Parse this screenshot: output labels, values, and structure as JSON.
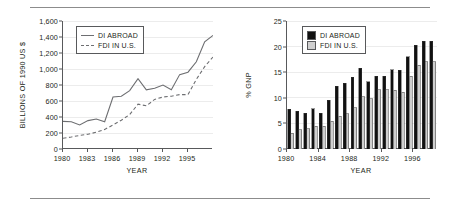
{
  "figure": {
    "panels": [
      {
        "id": "left",
        "ylabel": "BILLIONS OF 1990 US $",
        "xlabel": "YEAR",
        "legend": [
          {
            "label": "DI ABROAD",
            "style": "solid"
          },
          {
            "label": "FDI IN U.S.",
            "style": "dashed"
          }
        ]
      },
      {
        "id": "right",
        "ylabel": "% GNP",
        "xlabel": "YEAR",
        "legend": [
          {
            "label": "DI ABROAD",
            "style": "black"
          },
          {
            "label": "FDI IN U.S.",
            "style": "gray"
          }
        ]
      }
    ]
  },
  "chart_data": [
    {
      "type": "line",
      "title": "",
      "xlabel": "YEAR",
      "ylabel": "BILLIONS OF 1990 US $",
      "xlim": [
        1980,
        1998
      ],
      "ylim": [
        0,
        1600
      ],
      "yticks": [
        0,
        200,
        400,
        600,
        800,
        1000,
        1200,
        1400,
        1600
      ],
      "ytick_labels": [
        "0",
        "200",
        "400",
        "600",
        "800",
        "1,000",
        "1,200",
        "1,400",
        "1,600"
      ],
      "xticks": [
        1980,
        1983,
        1986,
        1989,
        1992,
        1995
      ],
      "xtick_labels": [
        "1980",
        "1983",
        "1986",
        "1989",
        "1992",
        "1995"
      ],
      "grid": true,
      "legend_position": "upper-left",
      "x": [
        1980,
        1981,
        1982,
        1983,
        1984,
        1985,
        1986,
        1987,
        1988,
        1989,
        1990,
        1991,
        1992,
        1993,
        1994,
        1995,
        1996,
        1997,
        1998
      ],
      "series": [
        {
          "name": "DI ABROAD",
          "style": "solid",
          "values": [
            345,
            340,
            300,
            355,
            375,
            340,
            650,
            660,
            730,
            880,
            740,
            760,
            800,
            740,
            930,
            960,
            1090,
            1340,
            1420
          ]
        },
        {
          "name": "FDI IN U.S.",
          "style": "dashed",
          "values": [
            135,
            150,
            170,
            185,
            210,
            245,
            300,
            360,
            430,
            560,
            540,
            620,
            650,
            660,
            680,
            680,
            870,
            1030,
            1150
          ]
        }
      ]
    },
    {
      "type": "bar",
      "title": "",
      "xlabel": "YEAR",
      "ylabel": "% GNP",
      "ylim": [
        0,
        25
      ],
      "yticks": [
        0,
        5,
        10,
        15,
        20,
        25
      ],
      "ytick_labels": [
        "0",
        "5",
        "10",
        "15",
        "20",
        "25"
      ],
      "xticks": [
        1980,
        1984,
        1988,
        1992,
        1996
      ],
      "xtick_labels": [
        "1980",
        "1984",
        "1988",
        "1992",
        "1996"
      ],
      "grid": true,
      "legend_position": "upper-left",
      "categories": [
        1980,
        1981,
        1982,
        1983,
        1984,
        1985,
        1986,
        1987,
        1988,
        1989,
        1990,
        1991,
        1992,
        1993,
        1994,
        1995,
        1996,
        1997,
        1998
      ],
      "series": [
        {
          "name": "DI ABROAD",
          "color": "#111111",
          "values": [
            7.8,
            7.4,
            7.0,
            7.9,
            7.0,
            9.5,
            12.3,
            12.8,
            14.0,
            15.8,
            13.1,
            14.2,
            14.2,
            15.5,
            15.4,
            18.0,
            20.3,
            21.0,
            21.0
          ]
        },
        {
          "name": "FDI IN U.S.",
          "color": "#cfcfcf",
          "values": [
            3.1,
            3.8,
            4.0,
            4.4,
            4.4,
            5.4,
            6.4,
            6.9,
            8.1,
            10.2,
            9.8,
            11.6,
            11.6,
            11.5,
            11.1,
            14.2,
            16.4,
            17.0,
            17.0
          ]
        }
      ]
    }
  ]
}
